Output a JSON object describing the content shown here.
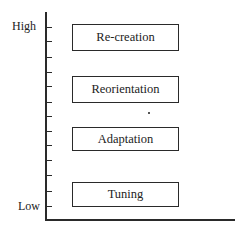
{
  "diagram": {
    "axis": {
      "high_label": "High",
      "low_label": "Low",
      "tick_count": 13
    },
    "levels": [
      {
        "label": "Re-creation",
        "rank": 4
      },
      {
        "label": "Reorientation",
        "rank": 3
      },
      {
        "label": "Adaptation",
        "rank": 2
      },
      {
        "label": "Tuning",
        "rank": 1
      }
    ],
    "colors": {
      "line": "#2a2a2a",
      "text": "#222222",
      "background": "#ffffff"
    }
  }
}
